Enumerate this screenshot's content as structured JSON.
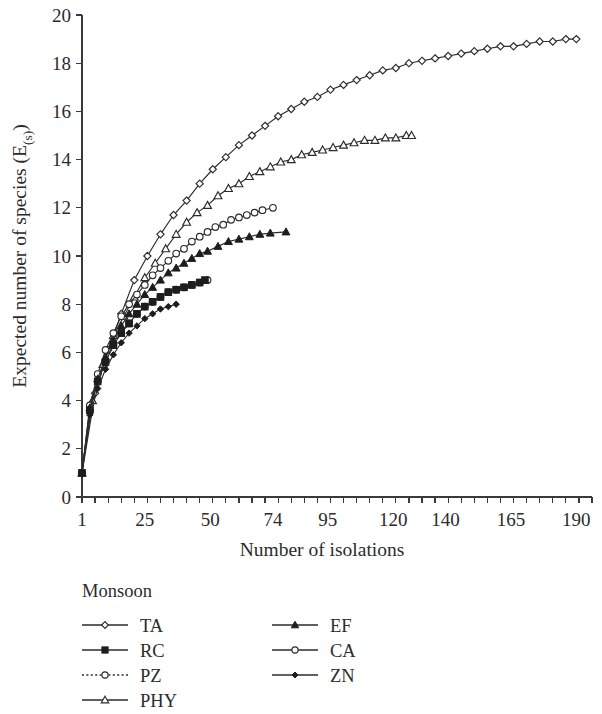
{
  "chart_data": {
    "type": "line",
    "title": "",
    "xlabel": "Number of isolations",
    "ylabel": "Expected number of species (E(s))",
    "ylabel_main": "Expected number of species (E",
    "ylabel_sub": "(s)",
    "ylabel_tail": ")",
    "xlim": [
      1,
      196
    ],
    "ylim": [
      0,
      20
    ],
    "grid": false,
    "y_ticks": [
      0,
      2,
      4,
      6,
      8,
      10,
      12,
      14,
      16,
      18,
      20
    ],
    "y_tick_labels": [
      "0",
      "2",
      "4",
      "6",
      "8",
      "10",
      "12",
      "14",
      "16",
      "18",
      "20"
    ],
    "x_ticks": [
      1,
      25,
      50,
      74,
      95,
      120,
      140,
      165,
      190
    ],
    "x_tick_labels": [
      "1",
      "25",
      "50",
      "74",
      "95",
      "120",
      "140",
      "165",
      "190"
    ],
    "x_minor_tick_step": 5,
    "legend_position": "below-left",
    "legend_title": "Monsoon",
    "series": [
      {
        "name": "TA",
        "marker": "diamond-open",
        "linestyle": "solid",
        "x": [
          1,
          6,
          11,
          16,
          21,
          26,
          31,
          36,
          41,
          46,
          51,
          56,
          61,
          66,
          71,
          76,
          81,
          86,
          91,
          96,
          101,
          106,
          111,
          116,
          121,
          126,
          131,
          136,
          141,
          146,
          151,
          156,
          161,
          166,
          171,
          176,
          181,
          186,
          190
        ],
        "values": [
          1,
          4.3,
          6.1,
          7.6,
          9.0,
          10.0,
          10.9,
          11.7,
          12.3,
          13.0,
          13.6,
          14.1,
          14.6,
          15.0,
          15.4,
          15.8,
          16.1,
          16.4,
          16.6,
          16.9,
          17.1,
          17.3,
          17.5,
          17.7,
          17.8,
          18.0,
          18.1,
          18.2,
          18.3,
          18.4,
          18.5,
          18.6,
          18.7,
          18.7,
          18.8,
          18.9,
          18.9,
          19.0,
          19.0
        ]
      },
      {
        "name": "PHY",
        "marker": "triangle-open",
        "linestyle": "solid",
        "x": [
          1,
          5,
          9,
          13,
          17,
          21,
          25,
          29,
          33,
          37,
          41,
          45,
          49,
          53,
          57,
          61,
          65,
          69,
          73,
          77,
          81,
          85,
          89,
          93,
          97,
          101,
          105,
          109,
          113,
          117,
          121,
          125,
          127
        ],
        "values": [
          1,
          4.0,
          5.5,
          6.7,
          7.5,
          8.3,
          9.1,
          9.7,
          10.3,
          10.9,
          11.4,
          11.8,
          12.1,
          12.5,
          12.8,
          13.0,
          13.3,
          13.5,
          13.7,
          13.9,
          14.0,
          14.2,
          14.3,
          14.4,
          14.5,
          14.6,
          14.7,
          14.8,
          14.8,
          14.9,
          14.9,
          15.0,
          15.0
        ]
      },
      {
        "name": "CA",
        "marker": "circle-open",
        "linestyle": "solid",
        "x": [
          1,
          4,
          7,
          10,
          13,
          16,
          19,
          22,
          25,
          28,
          31,
          34,
          37,
          40,
          43,
          46,
          49,
          52,
          55,
          58,
          61,
          64,
          67,
          70,
          74
        ],
        "values": [
          1,
          3.8,
          5.1,
          6.1,
          6.8,
          7.5,
          8.0,
          8.4,
          8.8,
          9.2,
          9.5,
          9.8,
          10.1,
          10.3,
          10.6,
          10.8,
          11.0,
          11.2,
          11.3,
          11.5,
          11.6,
          11.7,
          11.8,
          11.9,
          12.0
        ]
      },
      {
        "name": "EF",
        "marker": "triangle-filled",
        "linestyle": "solid",
        "x": [
          1,
          4,
          7,
          10,
          13,
          16,
          19,
          22,
          25,
          28,
          31,
          34,
          37,
          40,
          43,
          46,
          49,
          53,
          57,
          61,
          65,
          69,
          73,
          79
        ],
        "values": [
          1,
          3.7,
          4.9,
          5.8,
          6.5,
          7.1,
          7.6,
          8.0,
          8.4,
          8.7,
          9.0,
          9.3,
          9.5,
          9.7,
          9.9,
          10.1,
          10.2,
          10.4,
          10.6,
          10.7,
          10.8,
          10.9,
          10.95,
          11.0
        ]
      },
      {
        "name": "PZ",
        "marker": "circle-open",
        "linestyle": "dotted",
        "x": [
          1,
          4,
          7,
          10,
          13,
          16,
          19,
          22,
          25,
          28,
          31,
          34,
          37,
          40,
          43,
          46,
          49
        ],
        "values": [
          1,
          3.6,
          4.8,
          5.6,
          6.3,
          6.8,
          7.2,
          7.6,
          7.9,
          8.1,
          8.3,
          8.5,
          8.6,
          8.7,
          8.8,
          8.9,
          9.0
        ]
      },
      {
        "name": "RC",
        "marker": "square-filled",
        "linestyle": "solid",
        "x": [
          1,
          4,
          7,
          10,
          13,
          16,
          19,
          22,
          25,
          28,
          31,
          34,
          37,
          40,
          43,
          46,
          48
        ],
        "values": [
          1,
          3.6,
          4.8,
          5.6,
          6.3,
          6.8,
          7.2,
          7.6,
          7.9,
          8.1,
          8.3,
          8.5,
          8.6,
          8.7,
          8.8,
          8.9,
          9.0
        ]
      },
      {
        "name": "ZN",
        "marker": "diamond-filled",
        "linestyle": "solid",
        "x": [
          1,
          4,
          7,
          10,
          13,
          16,
          19,
          22,
          25,
          28,
          31,
          34,
          37
        ],
        "values": [
          1,
          3.4,
          4.5,
          5.3,
          5.9,
          6.4,
          6.8,
          7.1,
          7.4,
          7.6,
          7.8,
          7.9,
          8.0
        ]
      }
    ]
  },
  "legend": {
    "title": "Monsoon",
    "left_column": [
      {
        "label": "TA",
        "marker": "diamond-open",
        "linestyle": "solid"
      },
      {
        "label": "RC",
        "marker": "square-filled",
        "linestyle": "solid"
      },
      {
        "label": "PZ",
        "marker": "circle-open",
        "linestyle": "dotted"
      },
      {
        "label": "PHY",
        "marker": "triangle-open",
        "linestyle": "solid"
      }
    ],
    "right_column": [
      {
        "label": "EF",
        "marker": "triangle-filled",
        "linestyle": "solid"
      },
      {
        "label": "CA",
        "marker": "circle-open",
        "linestyle": "solid"
      },
      {
        "label": "ZN",
        "marker": "diamond-filled",
        "linestyle": "solid"
      }
    ]
  },
  "colors": {
    "ink": "#2b2b2b",
    "marker_fill_open": "#ffffff",
    "marker_fill_solid": "#1d1d1d",
    "background": "#ffffff"
  }
}
